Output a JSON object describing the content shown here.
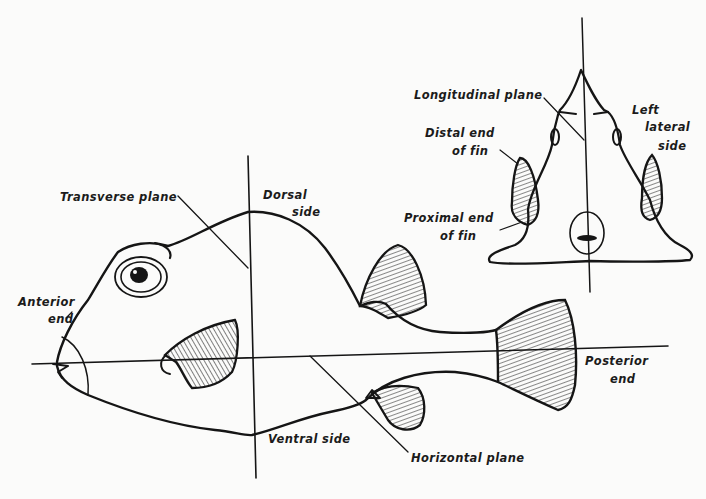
{
  "figure": {
    "side_view": {
      "labels": {
        "transverse_plane": "Transverse plane",
        "dorsal_side_1": "Dorsal",
        "dorsal_side_2": "side",
        "anterior_end_1": "Anterior",
        "anterior_end_2": "end",
        "ventral_side": "Ventral side",
        "horizontal_plane": "Horizontal plane",
        "posterior_end_1": "Posterior",
        "posterior_end_2": "end"
      }
    },
    "front_view": {
      "labels": {
        "longitudinal_plane": "Longitudinal plane",
        "left_lateral_side_1": "Left",
        "left_lateral_side_2": "lateral",
        "left_lateral_side_3": "side",
        "distal_end_1": "Distal end",
        "distal_end_2": "of fin",
        "proximal_end_1": "Proximal end",
        "proximal_end_2": "of fin"
      }
    },
    "colors": {
      "ink": "#151515",
      "paper": "#fbfbfa"
    }
  }
}
